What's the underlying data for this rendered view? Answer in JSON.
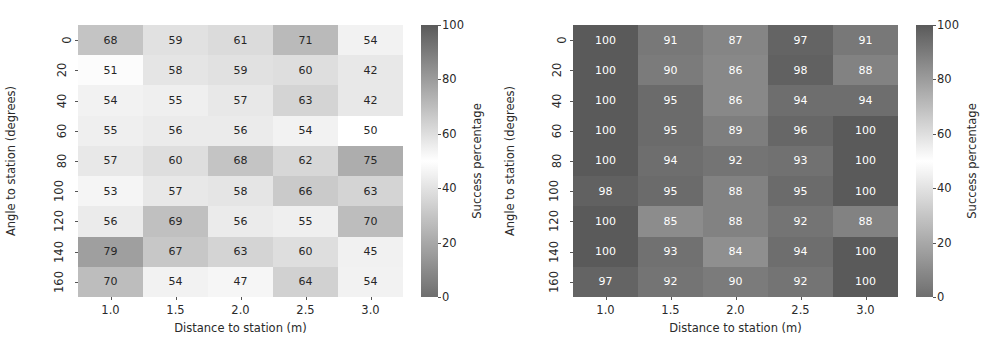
{
  "chart_data": [
    {
      "type": "heatmap",
      "panel": "left",
      "title": "",
      "xlabel": "Distance to station (m)",
      "ylabel": "Angle to station (degrees)",
      "xticklabels": [
        "1.0",
        "1.5",
        "2.0",
        "2.5",
        "3.0"
      ],
      "yticklabels": [
        "0",
        "20",
        "40",
        "60",
        "80",
        "100",
        "120",
        "140",
        "160"
      ],
      "x": [
        1.0,
        1.5,
        2.0,
        2.5,
        3.0
      ],
      "y": [
        0,
        20,
        40,
        60,
        80,
        100,
        120,
        140,
        160
      ],
      "values": [
        [
          68,
          59,
          61,
          71,
          54
        ],
        [
          51,
          58,
          59,
          60,
          42
        ],
        [
          54,
          55,
          57,
          63,
          42
        ],
        [
          55,
          56,
          56,
          54,
          50
        ],
        [
          57,
          60,
          68,
          62,
          75
        ],
        [
          53,
          57,
          58,
          66,
          63
        ],
        [
          56,
          69,
          56,
          55,
          70
        ],
        [
          79,
          67,
          63,
          60,
          45
        ],
        [
          70,
          54,
          47,
          64,
          54
        ]
      ],
      "annotate": true,
      "grid": false,
      "colorbar": {
        "label": "Success percentage",
        "ticks": [
          0,
          20,
          40,
          60,
          80,
          100
        ],
        "ticklabels": [
          "0",
          "20",
          "40",
          "60",
          "80",
          "100"
        ],
        "vmin": 0,
        "vmax": 100,
        "cmap": "diverging-gray-centered-50"
      }
    },
    {
      "type": "heatmap",
      "panel": "right",
      "title": "",
      "xlabel": "Distance to station (m)",
      "ylabel": "Angle to station (degrees)",
      "xticklabels": [
        "1.0",
        "1.5",
        "2.0",
        "2.5",
        "3.0"
      ],
      "yticklabels": [
        "0",
        "20",
        "40",
        "60",
        "80",
        "100",
        "120",
        "140",
        "160"
      ],
      "x": [
        1.0,
        1.5,
        2.0,
        2.5,
        3.0
      ],
      "y": [
        0,
        20,
        40,
        60,
        80,
        100,
        120,
        140,
        160
      ],
      "values": [
        [
          100,
          91,
          87,
          97,
          91
        ],
        [
          100,
          90,
          86,
          98,
          88
        ],
        [
          100,
          95,
          86,
          94,
          94
        ],
        [
          100,
          95,
          89,
          96,
          100
        ],
        [
          100,
          94,
          92,
          93,
          100
        ],
        [
          98,
          95,
          88,
          95,
          100
        ],
        [
          100,
          85,
          88,
          92,
          88
        ],
        [
          100,
          93,
          84,
          94,
          100
        ],
        [
          97,
          92,
          90,
          92,
          100
        ]
      ],
      "annotate": true,
      "grid": false,
      "colorbar": {
        "label": "Success percentage",
        "ticks": [
          0,
          20,
          40,
          60,
          80,
          100
        ],
        "ticklabels": [
          "0",
          "20",
          "40",
          "60",
          "80",
          "100"
        ],
        "vmin": 0,
        "vmax": 100,
        "cmap": "diverging-gray-centered-50"
      }
    }
  ],
  "colors": {
    "text": "#2a2a2a",
    "background": "#ffffff",
    "cmap_low": "#6e6e6e",
    "cmap_mid": "#ffffff",
    "cmap_high": "#5f5f5f"
  }
}
